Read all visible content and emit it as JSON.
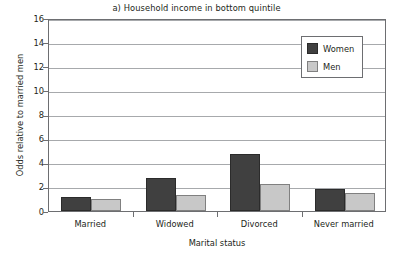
{
  "chart_data": {
    "type": "bar",
    "title": "a) Household income in bottom quintile",
    "xlabel": "Marital status",
    "ylabel": "Odds relative to married men",
    "categories": [
      "Married",
      "Widowed",
      "Divorced",
      "Never married"
    ],
    "series": [
      {
        "name": "Women",
        "color": "#404040",
        "values": [
          1.2,
          2.7,
          4.7,
          1.8
        ]
      },
      {
        "name": "Men",
        "color": "#c8c8c8",
        "values": [
          1.0,
          1.3,
          2.2,
          1.5
        ]
      }
    ],
    "ylim": [
      0,
      16
    ],
    "yticks": [
      0,
      2,
      4,
      6,
      8,
      10,
      12,
      14,
      16
    ],
    "ytick_labels": [
      "0",
      "2",
      "4",
      "6",
      "8",
      "10",
      "12",
      "14",
      "16"
    ],
    "grid": "horizontal",
    "legend_position": "top-right-inside",
    "legend_entries": [
      "Women",
      "Men"
    ]
  }
}
